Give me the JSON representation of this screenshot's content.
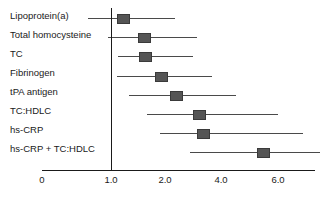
{
  "chart_data": {
    "type": "scatter",
    "subtype": "forest-plot",
    "title": "",
    "xlabel": "",
    "ylabel": "",
    "grid": false,
    "legend": null,
    "axis": {
      "tick_labels": [
        "0",
        "1.0",
        "2.0",
        "4.0",
        "6.0"
      ],
      "tick_values": [
        0,
        1.0,
        2.0,
        4.0,
        6.0
      ],
      "tick_pixel_x": [
        42,
        111,
        165,
        221,
        278
      ],
      "scale": "nonlinear-log-like",
      "reference_line_value": 1.0
    },
    "categories": [
      "Lipoprotein(a)",
      "Total homocysteine",
      "TC",
      "Fibrinogen",
      "tPA antigen",
      "TC:HDLC",
      "hs-CRP",
      "hs-CRP + TC:HDLC"
    ],
    "values": [
      1.2,
      1.55,
      1.55,
      1.85,
      2.1,
      2.9,
      3.0,
      5.1
    ],
    "ci_low": [
      0.75,
      1.0,
      1.1,
      1.08,
      1.3,
      1.6,
      1.9,
      2.65
    ],
    "ci_high": [
      2.2,
      2.7,
      2.3,
      3.25,
      3.85,
      5.8,
      6.3,
      6.8
    ],
    "series": [
      {
        "name": "Relative risk",
        "points": [
          {
            "label": "Lipoprotein(a)",
            "value": 1.2,
            "ci_low": 0.75,
            "ci_high": 2.2
          },
          {
            "label": "Total homocysteine",
            "value": 1.55,
            "ci_low": 1.0,
            "ci_high": 2.7
          },
          {
            "label": "TC",
            "value": 1.55,
            "ci_low": 1.1,
            "ci_high": 2.3
          },
          {
            "label": "Fibrinogen",
            "value": 1.85,
            "ci_low": 1.08,
            "ci_high": 3.25
          },
          {
            "label": "tPA antigen",
            "value": 2.1,
            "ci_low": 1.3,
            "ci_high": 3.85
          },
          {
            "label": "TC:HDLC",
            "value": 2.9,
            "ci_low": 1.6,
            "ci_high": 5.8
          },
          {
            "label": "hs-CRP",
            "value": 3.0,
            "ci_low": 1.9,
            "ci_high": 6.3
          },
          {
            "label": "hs-CRP + TC:HDLC",
            "value": 5.1,
            "ci_low": 2.65,
            "ci_high": 6.8
          }
        ]
      }
    ],
    "geometry": {
      "rows": [
        {
          "label": "Lipoprotein(a)",
          "label_x": 10,
          "label_y": 10,
          "line_y": 18,
          "line_x1": 88,
          "line_x2": 175,
          "marker_cx": 122,
          "marker_w": 11,
          "marker_h": 8
        },
        {
          "label": "Total homocysteine",
          "label_x": 10,
          "label_y": 29,
          "line_y": 37,
          "line_x1": 108,
          "line_x2": 197,
          "marker_cx": 143,
          "marker_w": 11,
          "marker_h": 8
        },
        {
          "label": "TC",
          "label_x": 10,
          "label_y": 48,
          "line_y": 56,
          "line_x1": 118,
          "line_x2": 193,
          "marker_cx": 144,
          "marker_w": 11,
          "marker_h": 8
        },
        {
          "label": "Fibrinogen",
          "label_x": 10,
          "label_y": 67,
          "line_y": 76,
          "line_x1": 117,
          "line_x2": 212,
          "marker_cx": 160,
          "marker_w": 11,
          "marker_h": 8
        },
        {
          "label": "tPA antigen",
          "label_x": 10,
          "label_y": 86,
          "line_y": 95,
          "line_x1": 129,
          "line_x2": 236,
          "marker_cx": 175,
          "marker_w": 11,
          "marker_h": 8
        },
        {
          "label": "TC:HDLC",
          "label_x": 10,
          "label_y": 105,
          "line_y": 114,
          "line_x1": 147,
          "line_x2": 278,
          "marker_cx": 198,
          "marker_w": 11,
          "marker_h": 8
        },
        {
          "label": "hs-CRP",
          "label_x": 10,
          "label_y": 124,
          "line_y": 133,
          "line_x1": 160,
          "line_x2": 303,
          "marker_cx": 202,
          "marker_w": 11,
          "marker_h": 8
        },
        {
          "label": "hs-CRP + TC:HDLC",
          "label_x": 10,
          "label_y": 143,
          "line_y": 152,
          "line_x1": 190,
          "line_x2": 320,
          "marker_cx": 262,
          "marker_w": 11,
          "marker_h": 8
        }
      ],
      "ref_line": {
        "x": 111,
        "y_top": 8,
        "y_bottom": 170
      },
      "axis_line": {
        "x1": 42,
        "x2": 315,
        "y": 170
      },
      "ticks": [
        {
          "label": "0",
          "x": 42,
          "show_mark": false
        },
        {
          "label": "1.0",
          "x": 111,
          "show_mark": true
        },
        {
          "label": "2.0",
          "x": 165,
          "show_mark": false
        },
        {
          "label": "4.0",
          "x": 221,
          "show_mark": false
        },
        {
          "label": "6.0",
          "x": 278,
          "show_mark": false
        }
      ],
      "tick_label_y": 174
    },
    "colors": {
      "marker": "#555555",
      "marker_border": "#3a3a3a",
      "ci_line": "#4a4a4a",
      "axis": "#1a1a1a",
      "text": "#1a1a1a",
      "background": "#ffffff"
    }
  }
}
